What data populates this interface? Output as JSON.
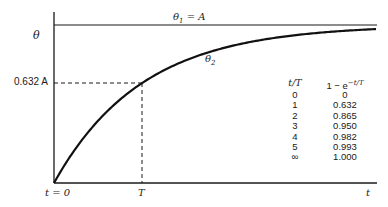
{
  "chart_data": {
    "type": "line",
    "title": "",
    "xlabel": "t",
    "ylabel": "θ",
    "series": [
      {
        "name": "θ1 = A",
        "kind": "step-input",
        "values_desc": "constant A for t ≥ 0"
      },
      {
        "name": "θ2",
        "kind": "first-order response",
        "formula": "θ2 = A(1 − e^(−t/T))"
      }
    ],
    "annotations": [
      {
        "text": "0.632 A",
        "at": "y-axis, dashed guide to curve at t = T"
      },
      {
        "text": "T",
        "at": "x-axis, dashed guide up to curve"
      },
      {
        "text": "t = 0",
        "at": "origin"
      }
    ],
    "table": {
      "columns": [
        "t/T",
        "1 − e^(−t/T)"
      ],
      "rows": [
        [
          "0",
          "0"
        ],
        [
          "1",
          "0.632"
        ],
        [
          "2",
          "0.865"
        ],
        [
          "3",
          "0.950"
        ],
        [
          "4",
          "0.982"
        ],
        [
          "5",
          "0.993"
        ],
        [
          "∞",
          "1.000"
        ]
      ]
    },
    "grid": false,
    "legend": "none (inline labels)"
  },
  "labels": {
    "y_axis": "θ",
    "theta1_prefix": "θ",
    "theta1_sub": "1",
    "theta1_rest": " = A",
    "theta2_main": "θ",
    "theta2_sub": "2",
    "y_mark": "0.632 A",
    "x_origin": "t = 0",
    "x_T": "T",
    "x_axis": "t"
  },
  "table": {
    "col1_header": "t/T",
    "col2_header_base": "1 − e",
    "col2_header_exp": "−t/T",
    "rows": [
      {
        "tT": "0",
        "val": "0"
      },
      {
        "tT": "1",
        "val": "0.632"
      },
      {
        "tT": "2",
        "val": "0.865"
      },
      {
        "tT": "3",
        "val": "0.950"
      },
      {
        "tT": "4",
        "val": "0.982"
      },
      {
        "tT": "5",
        "val": "0.993"
      },
      {
        "tT": "∞",
        "val": "1.000"
      }
    ]
  }
}
